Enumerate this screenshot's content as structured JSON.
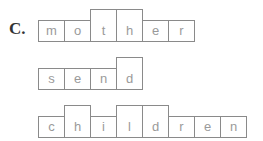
{
  "label": "C.",
  "words": [
    {
      "word": "mother",
      "top": 9,
      "letters": [
        {
          "ch": "m",
          "tall": false
        },
        {
          "ch": "o",
          "tall": false
        },
        {
          "ch": "t",
          "tall": true
        },
        {
          "ch": "h",
          "tall": true
        },
        {
          "ch": "e",
          "tall": false
        },
        {
          "ch": "r",
          "tall": false
        }
      ]
    },
    {
      "word": "send",
      "top": 57,
      "letters": [
        {
          "ch": "s",
          "tall": false
        },
        {
          "ch": "e",
          "tall": false
        },
        {
          "ch": "n",
          "tall": false
        },
        {
          "ch": "d",
          "tall": true
        }
      ]
    },
    {
      "word": "children",
      "top": 105,
      "letters": [
        {
          "ch": "c",
          "tall": false
        },
        {
          "ch": "h",
          "tall": true
        },
        {
          "ch": "i",
          "tall": false
        },
        {
          "ch": "l",
          "tall": true
        },
        {
          "ch": "d",
          "tall": true
        },
        {
          "ch": "r",
          "tall": false
        },
        {
          "ch": "e",
          "tall": false
        },
        {
          "ch": "n",
          "tall": false
        }
      ]
    }
  ]
}
